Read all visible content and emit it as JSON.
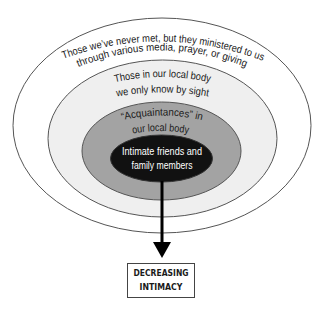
{
  "diagram": {
    "rings": [
      {
        "id": "outer",
        "lines": [
          "Those we’ve never met, but they ministered to us",
          "through various media, prayer, or giving"
        ],
        "fill": "#ffffff"
      },
      {
        "id": "second",
        "lines": [
          "Those in our local body",
          "we only know by sight"
        ],
        "fill": "#efefef"
      },
      {
        "id": "third",
        "lines": [
          "“Acquaintances” in",
          "our local body"
        ],
        "fill": "#a3a3a3"
      },
      {
        "id": "inner",
        "lines": [
          "Intimate friends and",
          "family members"
        ],
        "fill": "#111111"
      }
    ],
    "arrow": {
      "direction": "down",
      "label_lines": [
        "DECREASING",
        "INTIMACY"
      ]
    },
    "colors": {
      "stroke": "#555555",
      "text": "#1a1a1a",
      "inner_text": "#ffffff"
    }
  }
}
